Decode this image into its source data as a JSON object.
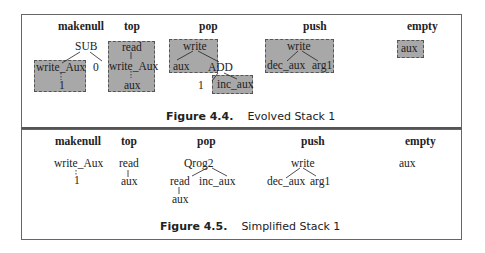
{
  "figures": [
    {
      "number": "Figure 4.4.",
      "caption": "Evolved Stack 1",
      "columns": [
        "makenull",
        "top",
        "pop",
        "push",
        "empty"
      ],
      "trees": {
        "makenull": {
          "root": "SUB",
          "children": [
            "write_Aux",
            "0"
          ],
          "grandchild": "1"
        },
        "top": {
          "nodes": [
            "read",
            "write_Aux",
            "aux"
          ]
        },
        "pop": {
          "root": "write",
          "children": [
            "aux",
            "ADD"
          ],
          "add_children": [
            "1",
            "inc_aux"
          ]
        },
        "push": {
          "root": "write",
          "children": [
            "dec_aux",
            "arg1"
          ]
        },
        "empty": {
          "node": "aux"
        }
      }
    },
    {
      "number": "Figure 4.5.",
      "caption": "Simplified Stack 1",
      "columns": [
        "makenull",
        "top",
        "pop",
        "push",
        "empty"
      ],
      "trees": {
        "makenull": {
          "nodes": [
            "write_Aux",
            "1"
          ]
        },
        "top": {
          "nodes": [
            "read",
            "aux"
          ]
        },
        "pop": {
          "root": "Qrog2",
          "children": [
            "read",
            "inc_aux"
          ],
          "grandchild": "aux"
        },
        "push": {
          "root": "write",
          "children": [
            "dec_aux",
            "arg1"
          ]
        },
        "empty": {
          "node": "aux"
        }
      }
    }
  ],
  "colors": {
    "highlight_box": "#a8a8a8",
    "frame": "#666666"
  }
}
